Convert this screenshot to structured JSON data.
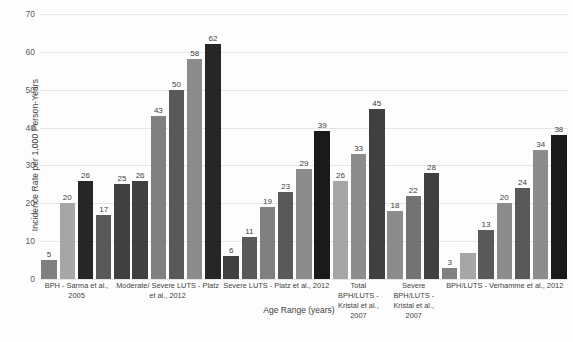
{
  "chart_data": {
    "type": "bar",
    "title": "",
    "xlabel": "Age Range (years)",
    "ylabel": "Incidence Rate per 1,000 Person-Years",
    "ylim": [
      0,
      70
    ],
    "yticks": [
      0,
      10,
      20,
      30,
      40,
      50,
      60,
      70
    ],
    "grid": true,
    "legend": "none",
    "categories": [
      "BPH - Sarma et al., 2005",
      "Moderate/ Severe LUTS - Platz et al., 2012",
      "Severe LUTS - Platz et al., 2012",
      "Total BPH/LUTS - Kristal et al., 2007",
      "Severe BPH/LUTS - Kristal et al., 2007",
      "BPH/LUTS - Verhamme et al., 2012"
    ],
    "groups": [
      {
        "category": "BPH - Sarma et al., 2005",
        "bars": [
          {
            "value": 5,
            "label": "5",
            "color": "#808080"
          },
          {
            "value": 20,
            "label": "20",
            "color": "#a6a6a6"
          },
          {
            "value": 26,
            "label": "26",
            "color": "#262626"
          },
          {
            "value": 17,
            "label": "17",
            "color": "#595959"
          }
        ]
      },
      {
        "category": "Moderate/ Severe LUTS - Platz et al., 2012",
        "bars": [
          {
            "value": 25,
            "label": "25",
            "color": "#404040"
          },
          {
            "value": 26,
            "label": "26",
            "color": "#404040"
          },
          {
            "value": 43,
            "label": "43",
            "color": "#808080"
          },
          {
            "value": 50,
            "label": "50",
            "color": "#595959"
          },
          {
            "value": 58,
            "label": "58",
            "color": "#8c8c8c"
          },
          {
            "value": 62,
            "label": "62",
            "color": "#262626"
          }
        ]
      },
      {
        "category": "Severe LUTS - Platz et al., 2012",
        "bars": [
          {
            "value": 6,
            "label": "6",
            "color": "#404040"
          },
          {
            "value": 11,
            "label": "11",
            "color": "#595959"
          },
          {
            "value": 19,
            "label": "19",
            "color": "#808080"
          },
          {
            "value": 23,
            "label": "23",
            "color": "#595959"
          },
          {
            "value": 29,
            "label": "29",
            "color": "#8c8c8c"
          },
          {
            "value": 39,
            "label": "39",
            "color": "#1a1a1a"
          }
        ]
      },
      {
        "category": "Total BPH/LUTS - Kristal et al., 2007",
        "bars": [
          {
            "value": 26,
            "label": "26",
            "color": "#a6a6a6"
          },
          {
            "value": 33,
            "label": "33",
            "color": "#8c8c8c"
          },
          {
            "value": 45,
            "label": "45",
            "color": "#404040"
          }
        ]
      },
      {
        "category": "Severe BPH/LUTS - Kristal et al., 2007",
        "bars": [
          {
            "value": 18,
            "label": "18",
            "color": "#8c8c8c"
          },
          {
            "value": 22,
            "label": "22",
            "color": "#737373"
          },
          {
            "value": 28,
            "label": "28",
            "color": "#404040"
          }
        ]
      },
      {
        "category": "BPH/LUTS - Verhamme et al., 2012",
        "bars": [
          {
            "value": 3,
            "label": "3",
            "color": "#808080"
          },
          {
            "value": 7,
            "label": "",
            "color": "#a6a6a6"
          },
          {
            "value": 13,
            "label": "13",
            "color": "#595959"
          },
          {
            "value": 20,
            "label": "20",
            "color": "#8c8c8c"
          },
          {
            "value": 24,
            "label": "24",
            "color": "#595959"
          },
          {
            "value": 34,
            "label": "34",
            "color": "#8c8c8c"
          },
          {
            "value": 38,
            "label": "38",
            "color": "#1a1a1a"
          }
        ]
      }
    ]
  }
}
